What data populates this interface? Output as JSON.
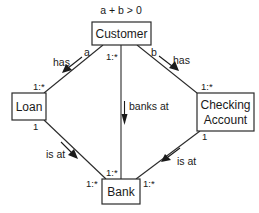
{
  "diagram": {
    "constraint": "a + b > 0",
    "nodes": [
      {
        "id": "customer",
        "label": "Customer"
      },
      {
        "id": "loan",
        "label": "Loan"
      },
      {
        "id": "checking",
        "label_line1": "Checking",
        "label_line2": "Account"
      },
      {
        "id": "bank",
        "label": "Bank"
      }
    ],
    "edges": [
      {
        "id": "customer-loan",
        "from": "Customer",
        "to": "Loan",
        "label": "has",
        "role_from": "a",
        "mult_to": "1:*"
      },
      {
        "id": "customer-checking",
        "from": "Customer",
        "to": "Checking Account",
        "label": "has",
        "role_from": "b",
        "mult_to": "1:*"
      },
      {
        "id": "customer-bank",
        "from": "Customer",
        "to": "Bank",
        "label": "banks at",
        "mult_from": "1:*",
        "mult_to": "1:*"
      },
      {
        "id": "loan-bank",
        "from": "Loan",
        "to": "Bank",
        "label": "is at",
        "mult_from": "1",
        "mult_to": "1:*"
      },
      {
        "id": "checking-bank",
        "from": "Checking Account",
        "to": "Bank",
        "label": "is at",
        "mult_from": "1",
        "mult_to": "1:*"
      }
    ]
  }
}
